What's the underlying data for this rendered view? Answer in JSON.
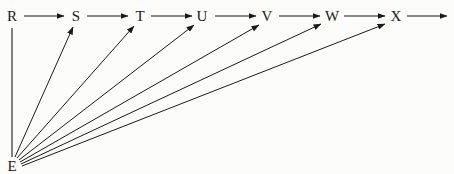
{
  "diagram": {
    "type": "directed-graph",
    "colors": {
      "line": "#1a1a1a",
      "background": "#fcfcfb"
    },
    "nodes": [
      {
        "id": "R",
        "label": "R",
        "x": 12,
        "y": 16
      },
      {
        "id": "S",
        "label": "S",
        "x": 76,
        "y": 16
      },
      {
        "id": "T",
        "label": "T",
        "x": 140,
        "y": 16
      },
      {
        "id": "U",
        "label": "U",
        "x": 202,
        "y": 16
      },
      {
        "id": "V",
        "label": "V",
        "x": 267,
        "y": 16
      },
      {
        "id": "W",
        "label": "W",
        "x": 332,
        "y": 16
      },
      {
        "id": "X",
        "label": "X",
        "x": 396,
        "y": 16
      },
      {
        "id": "E",
        "label": "E",
        "x": 12,
        "y": 166
      }
    ],
    "edges": [
      {
        "from": "R",
        "to": "S"
      },
      {
        "from": "S",
        "to": "T"
      },
      {
        "from": "T",
        "to": "U"
      },
      {
        "from": "U",
        "to": "V"
      },
      {
        "from": "V",
        "to": "W"
      },
      {
        "from": "W",
        "to": "X"
      },
      {
        "from": "X",
        "to": "out"
      },
      {
        "from": "E",
        "to": "R",
        "arrow": false
      },
      {
        "from": "E",
        "to": "S"
      },
      {
        "from": "E",
        "to": "T"
      },
      {
        "from": "E",
        "to": "U"
      },
      {
        "from": "E",
        "to": "V"
      },
      {
        "from": "E",
        "to": "W"
      },
      {
        "from": "E",
        "to": "X"
      }
    ]
  }
}
